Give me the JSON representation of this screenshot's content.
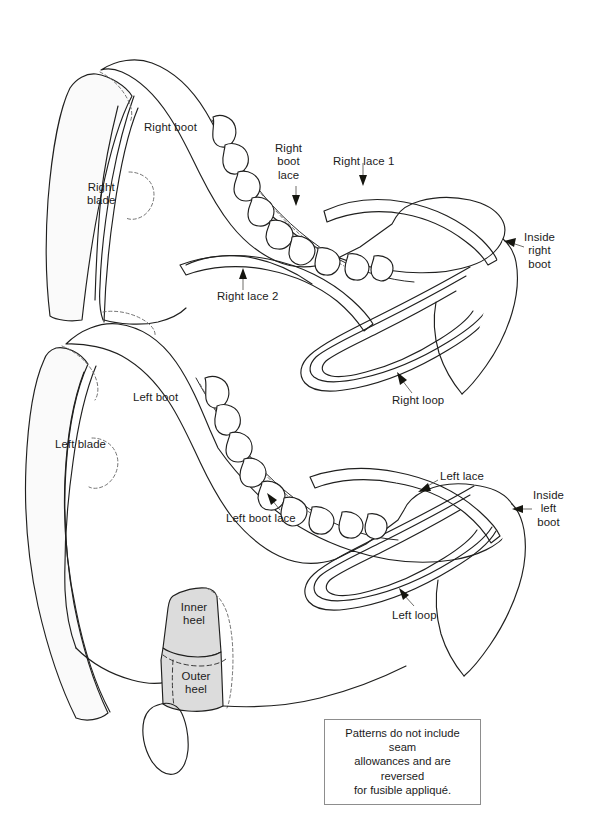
{
  "diagram": {
    "background_color": "#ffffff",
    "ink_color": "#20201f",
    "blade_fill": "#fafafa",
    "heel_fill": "#dcdcdc",
    "dashed_color": "#6d6d6d"
  },
  "labels": {
    "right_boot": "Right boot",
    "right_blade": "Right\nblade",
    "right_boot_lace": "Right\nboot\nlace",
    "right_lace_1": "Right lace 1",
    "right_lace_2": "Right lace 2",
    "inside_right_boot": "Inside\nright\nboot",
    "right_loop": "Right loop",
    "left_boot": "Left boot",
    "left_blade": "Left blade",
    "left_boot_lace": "Left boot lace",
    "left_lace": "Left lace",
    "inside_left_boot": "Inside\nleft\nboot",
    "left_loop": "Left loop",
    "inner_heel": "Inner\nheel",
    "outer_heel": "Outer\nheel"
  },
  "caption": {
    "line1": "Patterns do not include seam",
    "line2": "allowances and are reversed",
    "line3": "for fusible appliqué."
  },
  "parts": [
    {
      "name": "Right boot",
      "shaded": false
    },
    {
      "name": "Right blade",
      "shaded": false
    },
    {
      "name": "Right boot lace",
      "shaded": false
    },
    {
      "name": "Right lace 1",
      "shaded": false
    },
    {
      "name": "Right lace 2",
      "shaded": false
    },
    {
      "name": "Inside right boot",
      "shaded": false
    },
    {
      "name": "Right loop",
      "shaded": false
    },
    {
      "name": "Left boot",
      "shaded": false
    },
    {
      "name": "Left blade",
      "shaded": false
    },
    {
      "name": "Left boot lace",
      "shaded": false
    },
    {
      "name": "Left lace",
      "shaded": false
    },
    {
      "name": "Inside left boot",
      "shaded": false
    },
    {
      "name": "Left loop",
      "shaded": false
    },
    {
      "name": "Inner heel",
      "shaded": true
    },
    {
      "name": "Outer heel",
      "shaded": true
    }
  ]
}
